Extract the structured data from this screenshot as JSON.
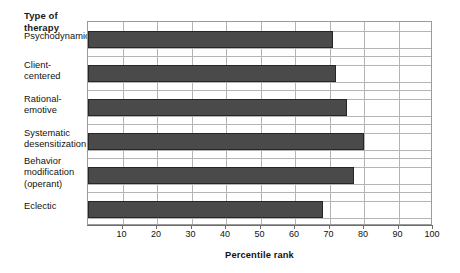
{
  "chart_data": {
    "type": "bar",
    "orientation": "horizontal",
    "title": "",
    "ylabel": "Type of therapy",
    "xlabel": "Percentile rank",
    "categories": [
      "Psychodynamic",
      "Client-centered",
      "Rational-emotive",
      "Systematic desensitization",
      "Behavior modification (operant)",
      "Eclectic"
    ],
    "category_label_lines": [
      [
        "Psychodynamic"
      ],
      [
        "Client-",
        "centered"
      ],
      [
        "Rational-",
        "emotive"
      ],
      [
        "Systematic",
        "desensitization"
      ],
      [
        "Behavior",
        "modification",
        "(operant)"
      ],
      [
        "Eclectic"
      ]
    ],
    "values": [
      71,
      72,
      75,
      80,
      77,
      68
    ],
    "xlim": [
      0,
      100
    ],
    "xticks": [
      10,
      20,
      30,
      40,
      50,
      60,
      70,
      80,
      90,
      100
    ],
    "xtick_labels": [
      "10",
      "20",
      "30",
      "40",
      "50",
      "60",
      "70",
      "80",
      "90",
      "100"
    ],
    "grid": "both",
    "legend": "none",
    "bar_color": "#4a4a4a",
    "bar_edge_color": "#262626",
    "grid_color": "#b4b4b4",
    "axis_color": "#6e6e6e",
    "background": "#ffffff"
  }
}
